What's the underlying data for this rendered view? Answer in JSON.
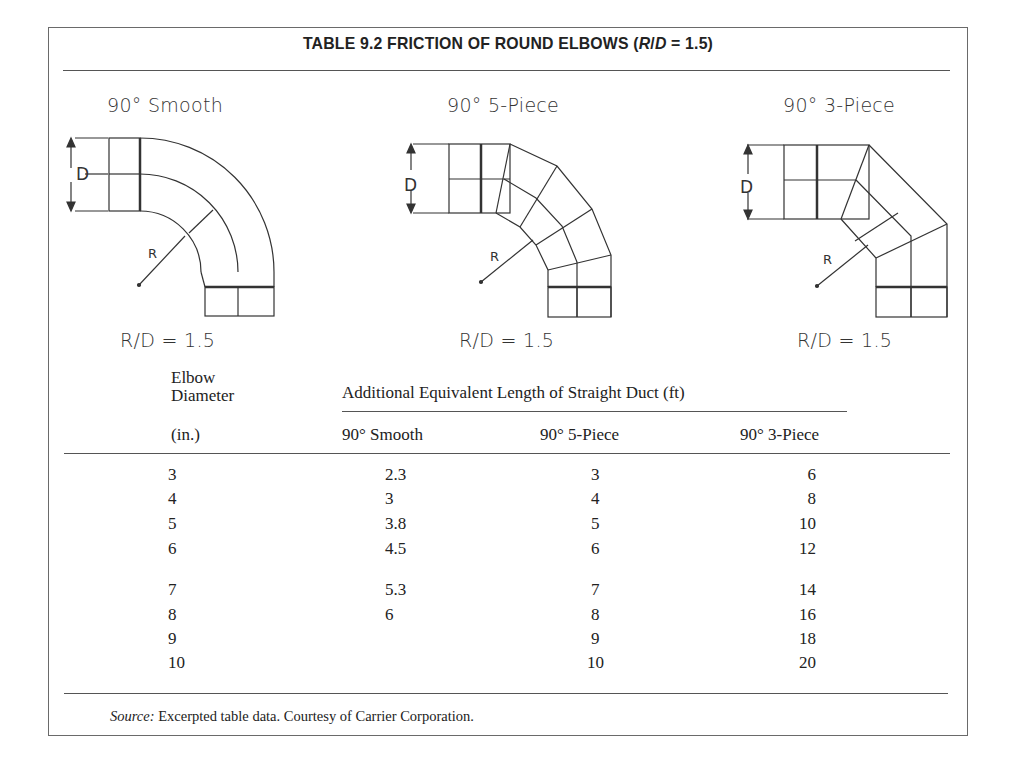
{
  "table": {
    "title_prefix": "TABLE 9.2  FRICTION OF ROUND ELBOWS (",
    "title_r": "R",
    "title_slash": "/",
    "title_d": "D",
    "title_suffix": " = 1.5)"
  },
  "figures": [
    {
      "label": "90° Smooth",
      "ratio": "R/D = 1.5",
      "dim_label": "D",
      "radius_label": "R"
    },
    {
      "label": "90° 5-Piece",
      "ratio": "R/D = 1.5",
      "dim_label": "D",
      "radius_label": "R"
    },
    {
      "label": "90° 3-Piece",
      "ratio": "R/D = 1.5",
      "dim_label": "D",
      "radius_label": "R"
    }
  ],
  "header": {
    "diameter_line1": "Elbow",
    "diameter_line2": "Diameter",
    "diameter_line3": "(in.)",
    "group_label": "Additional Equivalent Length of Straight Duct (ft)",
    "columns": [
      "90° Smooth",
      "90° 5-Piece",
      "90° 3-Piece"
    ]
  },
  "rows": [
    {
      "diameter": "3",
      "smooth": "2.3",
      "five_piece": "3",
      "three_piece": "6"
    },
    {
      "diameter": "4",
      "smooth": "3",
      "five_piece": "4",
      "three_piece": "8"
    },
    {
      "diameter": "5",
      "smooth": "3.8",
      "five_piece": "5",
      "three_piece": "10"
    },
    {
      "diameter": "6",
      "smooth": "4.5",
      "five_piece": "6",
      "three_piece": "12"
    },
    {
      "diameter": "7",
      "smooth": "5.3",
      "five_piece": "7",
      "three_piece": "14"
    },
    {
      "diameter": "8",
      "smooth": "6",
      "five_piece": "8",
      "three_piece": "16"
    },
    {
      "diameter": "9",
      "smooth": "",
      "five_piece": "9",
      "three_piece": "18"
    },
    {
      "diameter": "10",
      "smooth": "",
      "five_piece": "10",
      "three_piece": "20"
    }
  ],
  "footer": {
    "source_label": "Source:",
    "source_text": " Excerpted table data. Courtesy of Carrier Corporation."
  }
}
